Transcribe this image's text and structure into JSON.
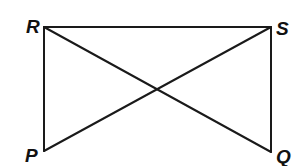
{
  "diagram": {
    "type": "geometry-figure",
    "stroke_color": "#1a1a1a",
    "vertices": [
      {
        "id": "R",
        "label": "R",
        "x": 44,
        "y": 27,
        "label_x": 26,
        "label_y": 33
      },
      {
        "id": "S",
        "label": "S",
        "x": 271,
        "y": 27,
        "label_x": 276,
        "label_y": 35
      },
      {
        "id": "P",
        "label": "P",
        "x": 44,
        "y": 151,
        "label_x": 25,
        "label_y": 162
      },
      {
        "id": "Q",
        "label": "Q",
        "x": 271,
        "y": 152,
        "label_x": 276,
        "label_y": 163
      }
    ],
    "segments": [
      {
        "name": "segment-RS",
        "from": "R",
        "to": "S"
      },
      {
        "name": "segment-RP",
        "from": "R",
        "to": "P"
      },
      {
        "name": "segment-SQ",
        "from": "S",
        "to": "Q"
      },
      {
        "name": "segment-RQ",
        "from": "R",
        "to": "Q"
      },
      {
        "name": "segment-SP",
        "from": "S",
        "to": "P"
      }
    ]
  }
}
